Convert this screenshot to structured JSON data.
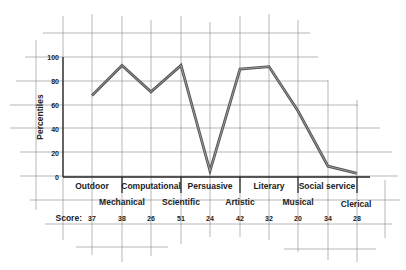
{
  "chart_data": {
    "type": "line",
    "title": "",
    "ylabel": "Percentiles",
    "xlabel": "",
    "ylim": [
      0,
      100
    ],
    "yticks": [
      0,
      20,
      40,
      60,
      80,
      100
    ],
    "grid": true,
    "categories": [
      "Outdoor",
      "Mechanical",
      "Computational",
      "Scientific",
      "Persuasive",
      "Artistic",
      "Literary",
      "Musical",
      "Social service",
      "Clerical"
    ],
    "values": [
      68,
      93,
      71,
      93,
      5,
      90,
      92,
      55,
      9,
      3
    ],
    "scores_label": "Score:",
    "scores": [
      37,
      38,
      26,
      51,
      24,
      42,
      32,
      20,
      34,
      28
    ],
    "line_color": "#555555"
  },
  "axis": {
    "ylabel": "Percentiles",
    "ticks": [
      "0",
      "20",
      "40",
      "60",
      "80",
      "100"
    ]
  },
  "categories_row1": [
    "Outdoor",
    "Computational",
    "Persuasive",
    "Literary",
    "Social service"
  ],
  "categories_row2": [
    "Mechanical",
    "Scientific",
    "Artistic",
    "Musical",
    "Clerical"
  ],
  "score_label": "Score:",
  "scores": [
    "37",
    "38",
    "26",
    "51",
    "24",
    "42",
    "32",
    "20",
    "34",
    "28"
  ]
}
